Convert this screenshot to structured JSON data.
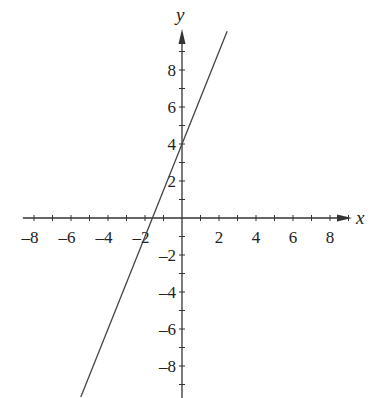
{
  "chart_data": {
    "type": "line",
    "title": "",
    "xlabel": "x",
    "ylabel": "y",
    "xlim": [
      -8.6,
      9.2
    ],
    "ylim": [
      -9.7,
      10.2
    ],
    "grid": false,
    "x_ticks": [
      -8,
      -7,
      -6,
      -5,
      -4,
      -3,
      -2,
      -1,
      1,
      2,
      3,
      4,
      5,
      6,
      7,
      8,
      9
    ],
    "y_ticks": [
      -9,
      -8,
      -7,
      -6,
      -5,
      -4,
      -3,
      -2,
      -1,
      1,
      2,
      3,
      4,
      5,
      6,
      7,
      8,
      9
    ],
    "x_tick_labels": [
      "-8",
      "-6",
      "-4",
      "-2",
      "2",
      "4",
      "6",
      "8"
    ],
    "x_tick_label_values": [
      -8,
      -6,
      -4,
      -2,
      2,
      4,
      6,
      8
    ],
    "y_tick_labels": [
      "8",
      "6",
      "4",
      "2",
      "-2",
      "-4",
      "-6",
      "-8"
    ],
    "y_tick_label_values": [
      8,
      6,
      4,
      2,
      -2,
      -4,
      -6,
      -8
    ],
    "series": [
      {
        "name": "y = 2.5x + 4",
        "slope": 2.5,
        "intercept": 4,
        "x": [
          -5.47,
          2.44
        ],
        "y": [
          -9.68,
          10.1
        ],
        "x_intercept": -1.6,
        "y_intercept": 4
      }
    ],
    "colors": {
      "axis": "#333333",
      "line": "#444444",
      "text": "#222222",
      "background": "#ffffff"
    }
  },
  "labels": {
    "x_axis": "x",
    "y_axis": "y"
  }
}
